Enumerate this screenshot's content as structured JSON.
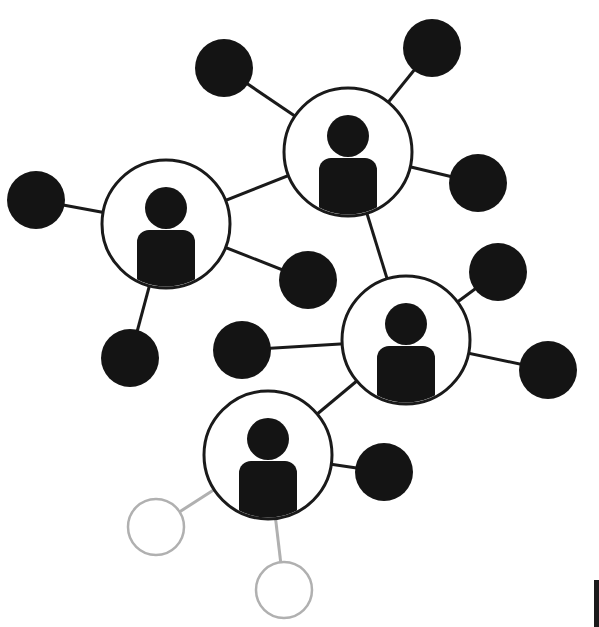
{
  "diagram": {
    "type": "network-graph",
    "colors": {
      "background": "#ffffff",
      "node_fill": "#141414",
      "edge": "#1a1a1a",
      "inactive": "#b0b0b0"
    },
    "hubs": [
      {
        "id": "hub-a",
        "icon": "person-icon",
        "cx": 166,
        "cy": 224,
        "r": 64
      },
      {
        "id": "hub-b",
        "icon": "person-icon",
        "cx": 348,
        "cy": 152,
        "r": 64
      },
      {
        "id": "hub-c",
        "icon": "person-icon",
        "cx": 406,
        "cy": 340,
        "r": 64
      },
      {
        "id": "hub-d",
        "icon": "person-icon",
        "cx": 268,
        "cy": 455,
        "r": 64
      }
    ],
    "nodes": [
      {
        "id": "n1",
        "cx": 224,
        "cy": 68,
        "r": 29,
        "state": "active"
      },
      {
        "id": "n2",
        "cx": 432,
        "cy": 48,
        "r": 29,
        "state": "active"
      },
      {
        "id": "n3",
        "cx": 478,
        "cy": 183,
        "r": 29,
        "state": "active"
      },
      {
        "id": "n4",
        "cx": 36,
        "cy": 200,
        "r": 29,
        "state": "active"
      },
      {
        "id": "n5",
        "cx": 308,
        "cy": 280,
        "r": 29,
        "state": "active"
      },
      {
        "id": "n6",
        "cx": 130,
        "cy": 358,
        "r": 29,
        "state": "active"
      },
      {
        "id": "n7",
        "cx": 242,
        "cy": 350,
        "r": 29,
        "state": "active"
      },
      {
        "id": "n8",
        "cx": 498,
        "cy": 272,
        "r": 29,
        "state": "active"
      },
      {
        "id": "n9",
        "cx": 548,
        "cy": 370,
        "r": 29,
        "state": "active"
      },
      {
        "id": "n10",
        "cx": 384,
        "cy": 472,
        "r": 29,
        "state": "active"
      },
      {
        "id": "n11",
        "cx": 156,
        "cy": 527,
        "r": 28,
        "state": "inactive"
      },
      {
        "id": "n12",
        "cx": 284,
        "cy": 590,
        "r": 28,
        "state": "inactive"
      }
    ],
    "edges": [
      [
        "hub-b",
        "n1"
      ],
      [
        "hub-b",
        "n2"
      ],
      [
        "hub-b",
        "n3"
      ],
      [
        "hub-b",
        "hub-a"
      ],
      [
        "hub-b",
        "hub-c"
      ],
      [
        "hub-a",
        "n4"
      ],
      [
        "hub-a",
        "n5"
      ],
      [
        "hub-a",
        "n6"
      ],
      [
        "hub-c",
        "n7"
      ],
      [
        "hub-c",
        "n8"
      ],
      [
        "hub-c",
        "n9"
      ],
      [
        "hub-c",
        "hub-d"
      ],
      [
        "hub-d",
        "n10"
      ],
      [
        "hub-d",
        "n11"
      ],
      [
        "hub-d",
        "n12"
      ]
    ]
  }
}
